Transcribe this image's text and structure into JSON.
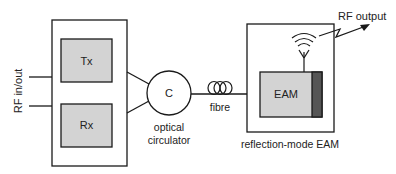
{
  "diagram": {
    "labels": {
      "rf_in_out": "RF in/out",
      "tx": "Tx",
      "rx": "Rx",
      "circulator_symbol": "C",
      "circulator_line1": "optical",
      "circulator_line2": "circulator",
      "fibre": "fibre",
      "eam": "EAM",
      "reflection_mode": "reflection-mode EAM",
      "rf_output": "RF output"
    },
    "colors": {
      "line": "#1a1a1a",
      "block_fill": "#d3d3d3",
      "reflector_fill": "#555555"
    }
  }
}
